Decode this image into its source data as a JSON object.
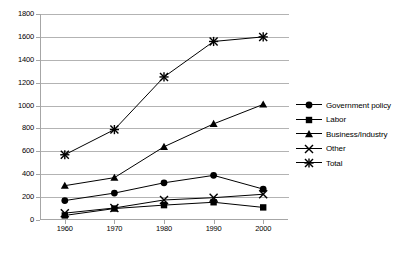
{
  "chart_data": {
    "type": "line",
    "title": "",
    "subtitle": "",
    "xlabel": "",
    "ylabel": "",
    "x": [
      1960,
      1970,
      1980,
      1990,
      2000
    ],
    "xtick_labels": [
      "1960",
      "1970",
      "1980",
      "1990",
      "2000"
    ],
    "ytick_labels": [
      "0",
      "200",
      "400",
      "600",
      "800",
      "1000",
      "1200",
      "1400",
      "1600",
      "1800"
    ],
    "ytick_values": [
      0,
      200,
      400,
      600,
      800,
      1000,
      1200,
      1400,
      1600,
      1800
    ],
    "ylim": [
      0,
      1800
    ],
    "xlim": [
      1955,
      2005
    ],
    "grid": "horizontal",
    "legend_position": "right",
    "series": [
      {
        "name": "Government policy",
        "marker": "circle",
        "color": "#000000",
        "values": [
          170,
          235,
          325,
          390,
          270
        ]
      },
      {
        "name": "Labor",
        "marker": "square",
        "color": "#000000",
        "values": [
          40,
          100,
          130,
          155,
          110
        ]
      },
      {
        "name": "Business/Industry",
        "marker": "triangle",
        "color": "#000000",
        "values": [
          300,
          370,
          640,
          840,
          1010
        ]
      },
      {
        "name": "Other",
        "marker": "cross-x",
        "color": "#000000",
        "values": [
          60,
          105,
          175,
          195,
          225
        ]
      },
      {
        "name": "Total",
        "marker": "asterisk",
        "color": "#000000",
        "values": [
          570,
          790,
          1250,
          1560,
          1600
        ]
      }
    ]
  },
  "axis": {
    "axis_line_color": "#a6a6a6",
    "gridline_color": "#b3b3b3",
    "background_color": "#ffffff"
  }
}
